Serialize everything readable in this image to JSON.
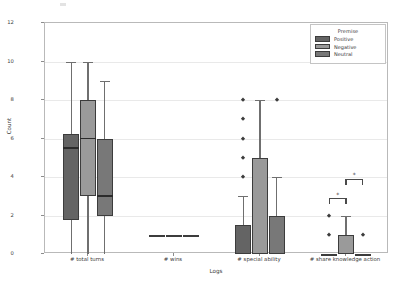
{
  "chart_data": {
    "type": "box",
    "title": "",
    "xlabel": "Logs",
    "ylabel": "Count",
    "ylim": [
      0,
      12
    ],
    "yticks": [
      0,
      2,
      4,
      6,
      8,
      10,
      12
    ],
    "grid": true,
    "categories": [
      "# total turns",
      "# wins",
      "# special ability",
      "# share knowledge action"
    ],
    "legend": {
      "title": "Premise",
      "position": "upper right",
      "entries": [
        {
          "name": "Positive",
          "color": "#646464"
        },
        {
          "name": "Negative",
          "color": "#9a9a9a"
        },
        {
          "name": "Neutral",
          "color": "#787878"
        }
      ]
    },
    "series": [
      {
        "name": "Positive",
        "color": "#646464",
        "boxes": [
          {
            "category": "# total turns",
            "whisker_low": 0,
            "q1": 1.75,
            "median": 5.5,
            "q3": 6.25,
            "whisker_high": 10,
            "outliers": []
          },
          {
            "category": "# wins",
            "whisker_low": 1,
            "q1": 1,
            "median": 1,
            "q3": 1,
            "whisker_high": 1,
            "outliers": []
          },
          {
            "category": "# special ability",
            "whisker_low": 0,
            "q1": 0,
            "median": 1.5,
            "q3": 1.5,
            "whisker_high": 3,
            "outliers": [
              8,
              7,
              6,
              5,
              4
            ]
          },
          {
            "category": "# share knowledge action",
            "whisker_low": 0,
            "q1": 0,
            "median": 0,
            "q3": 0,
            "whisker_high": 0,
            "outliers": [
              2,
              1
            ]
          }
        ]
      },
      {
        "name": "Negative",
        "color": "#9a9a9a",
        "boxes": [
          {
            "category": "# total turns",
            "whisker_low": 0,
            "q1": 3,
            "median": 6,
            "q3": 8,
            "whisker_high": 10,
            "outliers": []
          },
          {
            "category": "# wins",
            "whisker_low": 1,
            "q1": 1,
            "median": 1,
            "q3": 1,
            "whisker_high": 1,
            "outliers": []
          },
          {
            "category": "# special ability",
            "whisker_low": 0,
            "q1": 0,
            "median": 5,
            "q3": 5,
            "whisker_high": 8,
            "outliers": []
          },
          {
            "category": "# share knowledge action",
            "whisker_low": 0,
            "q1": 0,
            "median": 1,
            "q3": 1,
            "whisker_high": 2,
            "outliers": []
          }
        ]
      },
      {
        "name": "Neutral",
        "color": "#787878",
        "boxes": [
          {
            "category": "# total turns",
            "whisker_low": 0,
            "q1": 2,
            "median": 3,
            "q3": 6,
            "whisker_high": 9,
            "outliers": []
          },
          {
            "category": "# wins",
            "whisker_low": 1,
            "q1": 1,
            "median": 1,
            "q3": 1,
            "whisker_high": 1,
            "outliers": []
          },
          {
            "category": "# special ability",
            "whisker_low": 0,
            "q1": 0,
            "median": 2,
            "q3": 2,
            "whisker_high": 4,
            "outliers": [
              8
            ]
          },
          {
            "category": "# share knowledge action",
            "whisker_low": 0,
            "q1": 0,
            "median": 0,
            "q3": 0,
            "whisker_high": 0,
            "outliers": [
              1
            ]
          }
        ]
      }
    ],
    "annotations": [
      {
        "label": "*",
        "category": "# share knowledge action",
        "from": "Positive",
        "to": "Negative",
        "y": 2.9
      },
      {
        "label": "*",
        "category": "# share knowledge action",
        "from": "Negative",
        "to": "Neutral",
        "y": 3.9
      }
    ]
  }
}
